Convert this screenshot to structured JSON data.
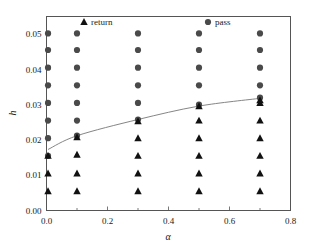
{
  "chart_data": {
    "type": "scatter",
    "title": "",
    "xlabel": "α",
    "ylabel": "h",
    "xlim": [
      0.0,
      0.8
    ],
    "ylim": [
      0.0,
      0.055
    ],
    "xticks": [
      0.0,
      0.2,
      0.4,
      0.6,
      0.8
    ],
    "xticklabels": [
      "0.0",
      "0.2",
      "0.4",
      "0.6",
      "0.8"
    ],
    "yticks": [
      0.0,
      0.01,
      0.02,
      0.03,
      0.04,
      0.05
    ],
    "yticklabels": [
      "0.00",
      "0.01",
      "0.02",
      "0.03",
      "0.04",
      "0.05"
    ],
    "xminorticks": [
      0.1,
      0.3,
      0.5,
      0.7
    ],
    "yminorticks": [
      0.005,
      0.015,
      0.025,
      0.035,
      0.045
    ],
    "grid": false,
    "legend_position": "top-inside",
    "legend": [
      {
        "name": "return",
        "marker": "triangle",
        "color": "#111111"
      },
      {
        "name": "pass",
        "marker": "circle",
        "color": "#4a4a4a"
      }
    ],
    "series": [
      {
        "name": "pass",
        "marker": "circle",
        "color": "#4a4a4a",
        "points": [
          {
            "x": 0.005,
            "y": 0.0155
          },
          {
            "x": 0.005,
            "y": 0.0205
          },
          {
            "x": 0.005,
            "y": 0.0255
          },
          {
            "x": 0.005,
            "y": 0.0305
          },
          {
            "x": 0.005,
            "y": 0.0355
          },
          {
            "x": 0.005,
            "y": 0.0405
          },
          {
            "x": 0.005,
            "y": 0.0455
          },
          {
            "x": 0.005,
            "y": 0.0502
          },
          {
            "x": 0.1,
            "y": 0.0212
          },
          {
            "x": 0.1,
            "y": 0.0255
          },
          {
            "x": 0.1,
            "y": 0.0305
          },
          {
            "x": 0.1,
            "y": 0.0355
          },
          {
            "x": 0.1,
            "y": 0.0405
          },
          {
            "x": 0.1,
            "y": 0.0455
          },
          {
            "x": 0.1,
            "y": 0.0502
          },
          {
            "x": 0.3,
            "y": 0.0258
          },
          {
            "x": 0.3,
            "y": 0.0305
          },
          {
            "x": 0.3,
            "y": 0.0355
          },
          {
            "x": 0.3,
            "y": 0.0405
          },
          {
            "x": 0.3,
            "y": 0.0455
          },
          {
            "x": 0.3,
            "y": 0.0502
          },
          {
            "x": 0.5,
            "y": 0.03
          },
          {
            "x": 0.5,
            "y": 0.0355
          },
          {
            "x": 0.5,
            "y": 0.0405
          },
          {
            "x": 0.5,
            "y": 0.0455
          },
          {
            "x": 0.5,
            "y": 0.0502
          },
          {
            "x": 0.7,
            "y": 0.032
          },
          {
            "x": 0.7,
            "y": 0.0355
          },
          {
            "x": 0.7,
            "y": 0.0405
          },
          {
            "x": 0.7,
            "y": 0.0455
          },
          {
            "x": 0.7,
            "y": 0.0502
          }
        ]
      },
      {
        "name": "return",
        "marker": "triangle",
        "color": "#111111",
        "points": [
          {
            "x": 0.005,
            "y": 0.0055
          },
          {
            "x": 0.005,
            "y": 0.0105
          },
          {
            "x": 0.005,
            "y": 0.0155
          },
          {
            "x": 0.1,
            "y": 0.0055
          },
          {
            "x": 0.1,
            "y": 0.0105
          },
          {
            "x": 0.1,
            "y": 0.0158
          },
          {
            "x": 0.1,
            "y": 0.0208
          },
          {
            "x": 0.3,
            "y": 0.0055
          },
          {
            "x": 0.3,
            "y": 0.0105
          },
          {
            "x": 0.3,
            "y": 0.0155
          },
          {
            "x": 0.3,
            "y": 0.0205
          },
          {
            "x": 0.3,
            "y": 0.0253
          },
          {
            "x": 0.5,
            "y": 0.0055
          },
          {
            "x": 0.5,
            "y": 0.0105
          },
          {
            "x": 0.5,
            "y": 0.0155
          },
          {
            "x": 0.5,
            "y": 0.0205
          },
          {
            "x": 0.5,
            "y": 0.0255
          },
          {
            "x": 0.5,
            "y": 0.0296
          },
          {
            "x": 0.7,
            "y": 0.0055
          },
          {
            "x": 0.7,
            "y": 0.0105
          },
          {
            "x": 0.7,
            "y": 0.0155
          },
          {
            "x": 0.7,
            "y": 0.0205
          },
          {
            "x": 0.7,
            "y": 0.0255
          },
          {
            "x": 0.7,
            "y": 0.0305
          },
          {
            "x": 0.7,
            "y": 0.0313
          }
        ]
      }
    ],
    "boundary_curve": {
      "name": "critical-boundary",
      "color": "#777777",
      "points": [
        {
          "x": 0.005,
          "y": 0.0173
        },
        {
          "x": 0.1,
          "y": 0.0212
        },
        {
          "x": 0.3,
          "y": 0.0258
        },
        {
          "x": 0.5,
          "y": 0.0296
        },
        {
          "x": 0.7,
          "y": 0.0318
        }
      ]
    }
  }
}
